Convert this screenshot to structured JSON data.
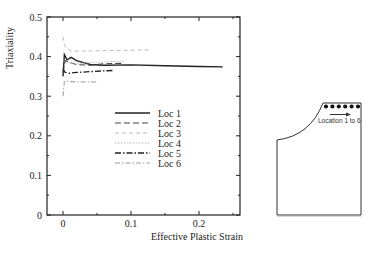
{
  "chart_data": {
    "type": "line",
    "title": "",
    "xlabel": "Effective Plastic Strain",
    "ylabel": "Triaxiality",
    "xlim": [
      -0.015,
      0.24
    ],
    "ylim": [
      0,
      0.5
    ],
    "x_ticks": [
      "0",
      "0.1",
      "0.2"
    ],
    "y_ticks": [
      "0",
      "0.1",
      "0.2",
      "0.3",
      "0.4",
      "0.5"
    ],
    "grid": false,
    "legend_position": "center",
    "series": [
      {
        "name": "Loc 1",
        "style": "solid",
        "color": "#222222",
        "x": [
          0,
          0.002,
          0.006,
          0.012,
          0.02,
          0.04,
          0.06,
          0.1,
          0.15,
          0.2,
          0.235
        ],
        "y": [
          0.35,
          0.405,
          0.392,
          0.398,
          0.39,
          0.38,
          0.378,
          0.379,
          0.377,
          0.375,
          0.374
        ]
      },
      {
        "name": "Loc 2",
        "style": "dashed",
        "color": "#444444",
        "x": [
          0,
          0.003,
          0.01,
          0.02,
          0.04,
          0.06,
          0.09
        ],
        "y": [
          0.36,
          0.39,
          0.385,
          0.38,
          0.378,
          0.382,
          0.383
        ]
      },
      {
        "name": "Loc 3",
        "style": "dashed-light",
        "color": "#bbbbbb",
        "x": [
          0,
          0.002,
          0.006,
          0.012,
          0.03,
          0.06,
          0.1,
          0.13
        ],
        "y": [
          0.45,
          0.43,
          0.42,
          0.414,
          0.414,
          0.415,
          0.416,
          0.417
        ]
      },
      {
        "name": "Loc 4",
        "style": "dotted",
        "color": "#bbbbbb",
        "x": [
          0,
          0.005,
          0.02,
          0.04,
          0.07,
          0.09
        ],
        "y": [
          0.39,
          0.385,
          0.382,
          0.385,
          0.387,
          0.388
        ]
      },
      {
        "name": "Loc 5",
        "style": "dash-dot",
        "color": "#222222",
        "x": [
          0,
          0.003,
          0.01,
          0.02,
          0.04,
          0.06,
          0.075
        ],
        "y": [
          0.37,
          0.36,
          0.358,
          0.36,
          0.362,
          0.364,
          0.365
        ]
      },
      {
        "name": "Loc 6",
        "style": "dash-dot-light",
        "color": "#999999",
        "x": [
          0,
          0.002,
          0.01,
          0.02,
          0.035,
          0.05
        ],
        "y": [
          0.3,
          0.338,
          0.337,
          0.336,
          0.336,
          0.336
        ]
      }
    ]
  },
  "diagram": {
    "label": "Location 1 to 6",
    "dot_count": 6
  }
}
